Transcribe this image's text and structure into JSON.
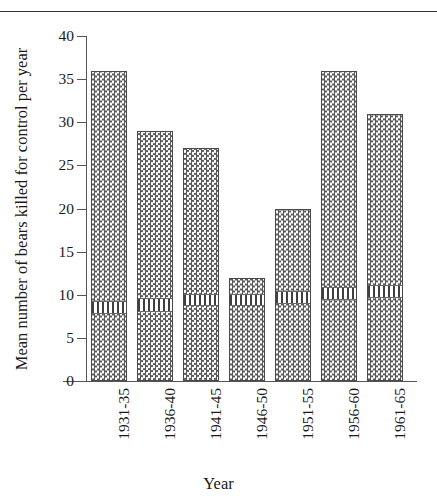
{
  "chart_data": {
    "type": "bar",
    "title": "",
    "subtitle": "",
    "xlabel": "Year",
    "ylabel": "Mean number of bears killed for control per year",
    "categories": [
      "1931-35",
      "1936-40",
      "1941-45",
      "1946-50",
      "1951-55",
      "1956-60",
      "1961-65"
    ],
    "values": [
      36,
      29,
      27,
      12,
      20,
      36,
      31
    ],
    "series": [
      {
        "name": "Mean number of bears killed for control per year",
        "values": [
          36,
          29,
          27,
          12,
          20,
          36,
          31
        ]
      }
    ],
    "band_markers": [
      {
        "category": "1931-35",
        "from": 8.1,
        "to": 9.4
      },
      {
        "category": "1936-40",
        "from": 8.4,
        "to": 9.7
      },
      {
        "category": "1941-45",
        "from": 9.0,
        "to": 10.2
      },
      {
        "category": "1946-50",
        "from": 9.0,
        "to": 10.2
      },
      {
        "category": "1951-55",
        "from": 9.3,
        "to": 10.5
      },
      {
        "category": "1956-60",
        "from": 9.7,
        "to": 11.0
      },
      {
        "category": "1961-65",
        "from": 10.0,
        "to": 11.3
      }
    ],
    "ylim": [
      0,
      40
    ],
    "yticks": [
      0,
      5,
      10,
      15,
      20,
      25,
      30,
      35,
      40
    ],
    "ytick_labels": [
      "0",
      "5",
      "10",
      "15",
      "20",
      "25",
      "30",
      "35",
      "40"
    ],
    "grid": false,
    "legend": "none",
    "bar_fill_pattern": "checkerboard",
    "band_fill_pattern": "vertical-stripes",
    "colors": {
      "axis": "#555555",
      "text": "#1a1a1a",
      "bar_fill": "#5b5b5b",
      "bar_background": "#ffffff",
      "bar_border": "#4a4a4a",
      "band_stripe": "#3f3f3f",
      "top_rule": "#333333",
      "page_background": "#ffffff"
    }
  }
}
